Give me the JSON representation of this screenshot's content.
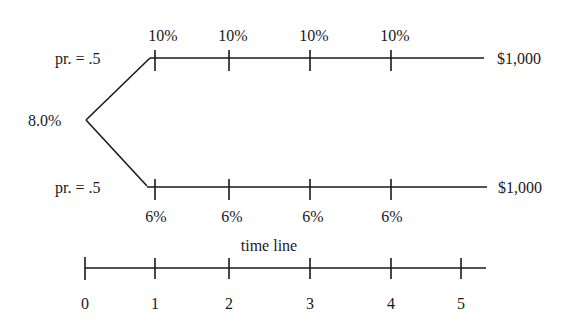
{
  "diagram": {
    "type": "binomial interest rate tree",
    "root_rate": "8.0%",
    "branches": [
      {
        "name": "up",
        "probability_label": "pr.  = .5",
        "rates": [
          "10%",
          "10%",
          "10%",
          "10%"
        ],
        "terminal_value": "$1,000"
      },
      {
        "name": "down",
        "probability_label": "pr.  = .5",
        "rates": [
          "6%",
          "6%",
          "6%",
          "6%"
        ],
        "terminal_value": "$1,000"
      }
    ],
    "timeline": {
      "title": "time line",
      "ticks": [
        "0",
        "1",
        "2",
        "3",
        "4",
        "5"
      ]
    },
    "colors": {
      "line": "#1a1a1a",
      "background": "#ffffff"
    }
  }
}
